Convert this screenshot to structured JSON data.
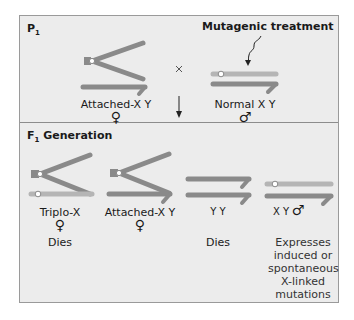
{
  "colors": {
    "panel_bg": "#ececec",
    "border": "#9a9a9a",
    "x_chromosome": "#b5b5b5",
    "y_chromosome": "#8a8a8a",
    "attached_x": "#8a8a8a",
    "centromere": "#ffffff"
  },
  "p1": {
    "section_label": "P",
    "section_sub": "1",
    "female": {
      "label": "Attached-X Y",
      "symbol": "♀"
    },
    "cross_symbol": "×",
    "male": {
      "label": "Normal X Y",
      "symbol": "♂"
    },
    "treatment_label": "Mutagenic treatment"
  },
  "f1": {
    "section_label": "F",
    "section_sub": "1",
    "section_suffix": " Generation",
    "progeny": [
      {
        "label": "Triplo-X",
        "symbol": "♀",
        "fate": "Dies"
      },
      {
        "label": "Attached-X Y",
        "symbol": "♀",
        "fate": ""
      },
      {
        "label": "Y Y",
        "symbol": "",
        "fate": "Dies"
      },
      {
        "label": "X Y",
        "symbol": "♂",
        "fate": "Expresses induced or spontaneous X-linked mutations"
      }
    ],
    "fate_lines": [
      "Expresses",
      "induced or",
      "spontaneous",
      "X-linked",
      "mutations"
    ]
  }
}
